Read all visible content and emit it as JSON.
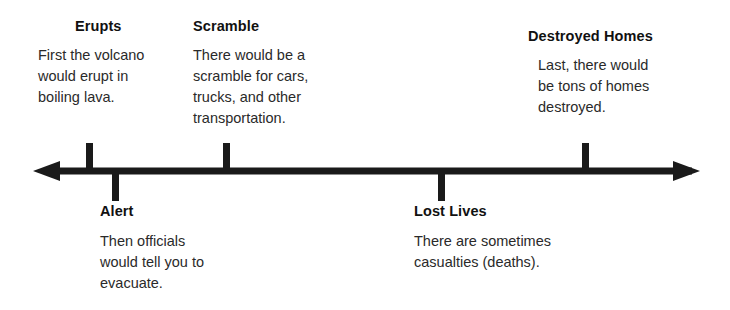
{
  "diagram": {
    "type": "timeline",
    "axis": {
      "name": "double-headed-timeline-arrow",
      "color": "#1a1a1a",
      "line_y": 171,
      "start_x": 33,
      "end_x": 700,
      "left_arrowhead": true,
      "right_arrowhead": true,
      "thickness": 7
    },
    "events": [
      {
        "id": "erupts",
        "title": "Erupts",
        "body": "First the volcano\nwould erupt in\nboiling lava.",
        "position": "above",
        "tick_x": 90,
        "order": 1
      },
      {
        "id": "alert",
        "title": "Alert",
        "body": "Then officials\nwould tell you to\nevacuate.",
        "position": "below",
        "tick_x": 116,
        "order": 2
      },
      {
        "id": "scramble",
        "title": "Scramble",
        "body": "There would be a\nscramble for cars,\ntrucks, and other\ntransportation.",
        "position": "above",
        "tick_x": 227,
        "order": 3
      },
      {
        "id": "lost-lives",
        "title": "Lost Lives",
        "body": "There are sometimes\ncasualties (deaths).",
        "position": "below",
        "tick_x": 442,
        "order": 4
      },
      {
        "id": "destroyed-homes",
        "title": "Destroyed Homes",
        "body": "Last, there would\nbe tons of homes\ndestroyed.",
        "position": "above",
        "tick_x": 586,
        "order": 5
      }
    ]
  },
  "colors": {
    "background": "#ffffff",
    "ink": "#1a1a1a",
    "body_text": "#2a2a2a"
  }
}
